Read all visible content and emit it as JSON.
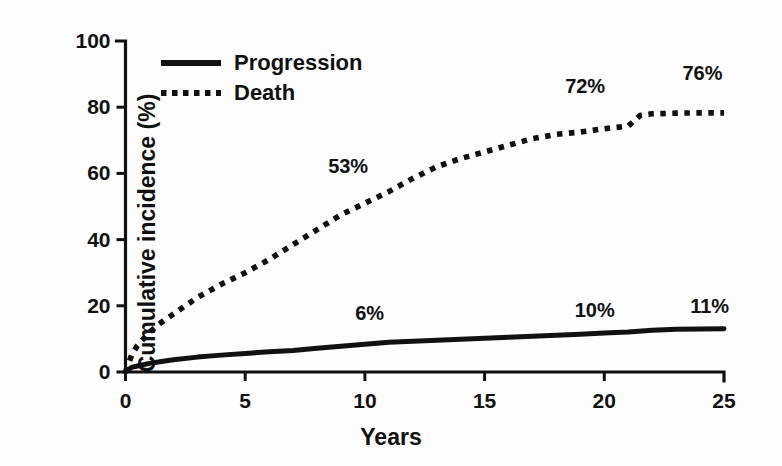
{
  "chart_data": {
    "type": "line",
    "title": "",
    "xlabel": "Years",
    "ylabel": "Cumulative incidence (%)",
    "xlim": [
      0,
      25
    ],
    "ylim": [
      0,
      100
    ],
    "xticks": [
      "0",
      "5",
      "10",
      "15",
      "20",
      "25"
    ],
    "yticks": [
      "0",
      "20",
      "40",
      "60",
      "80",
      "100"
    ],
    "grid": false,
    "legend_position": "upper-left-inside",
    "series": [
      {
        "name": "Progression",
        "style": "solid",
        "color": "#111111",
        "x": [
          0,
          0.25,
          0.5,
          1,
          1.5,
          2,
          3,
          4,
          5,
          6,
          7,
          8,
          9,
          10,
          11,
          12,
          13,
          14,
          15,
          16,
          17,
          18,
          19,
          20,
          21,
          22,
          23,
          24,
          25
        ],
        "y": [
          0,
          1.4,
          1.8,
          2.6,
          3.2,
          3.7,
          4.5,
          5.1,
          5.6,
          6.1,
          6.5,
          7.2,
          7.8,
          8.4,
          9.0,
          9.3,
          9.6,
          9.9,
          10.2,
          10.5,
          10.8,
          11.1,
          11.4,
          11.8,
          12.1,
          12.6,
          12.9,
          13.0,
          13.1
        ]
      },
      {
        "name": "Death",
        "style": "dotted",
        "color": "#111111",
        "x": [
          0,
          0.25,
          0.5,
          1,
          1.5,
          2,
          3,
          4,
          5,
          6,
          7,
          8,
          9,
          10,
          11,
          12,
          13,
          14,
          15,
          16,
          17,
          18,
          19,
          20,
          21,
          21.5,
          22,
          23,
          24,
          25
        ],
        "y": [
          0,
          5.0,
          8.0,
          12.0,
          15.0,
          17.5,
          22.5,
          26.5,
          30.0,
          34.0,
          38.5,
          43.0,
          47.5,
          51.0,
          54.5,
          58.5,
          62.0,
          64.5,
          66.5,
          68.5,
          70.5,
          71.8,
          72.5,
          73.5,
          74.3,
          77.5,
          78.0,
          78.2,
          78.3,
          78.3
        ]
      }
    ],
    "annotations": [
      {
        "text": "53%",
        "x": 9.3,
        "y": 62.0,
        "series": "Death"
      },
      {
        "text": "72%",
        "x": 19.2,
        "y": 86.0,
        "series": "Death"
      },
      {
        "text": "76%",
        "x": 24.1,
        "y": 90.0,
        "series": "Death"
      },
      {
        "text": "6%",
        "x": 10.2,
        "y": 17.5,
        "series": "Progression"
      },
      {
        "text": "10%",
        "x": 19.6,
        "y": 18.5,
        "series": "Progression"
      },
      {
        "text": "11%",
        "x": 24.4,
        "y": 19.5,
        "series": "Progression"
      }
    ]
  },
  "legend": {
    "items": [
      {
        "label": "Progression",
        "style": "solid"
      },
      {
        "label": "Death",
        "style": "dotted"
      }
    ]
  },
  "colors": {
    "foreground": "#111111",
    "background": "#ffffff"
  }
}
